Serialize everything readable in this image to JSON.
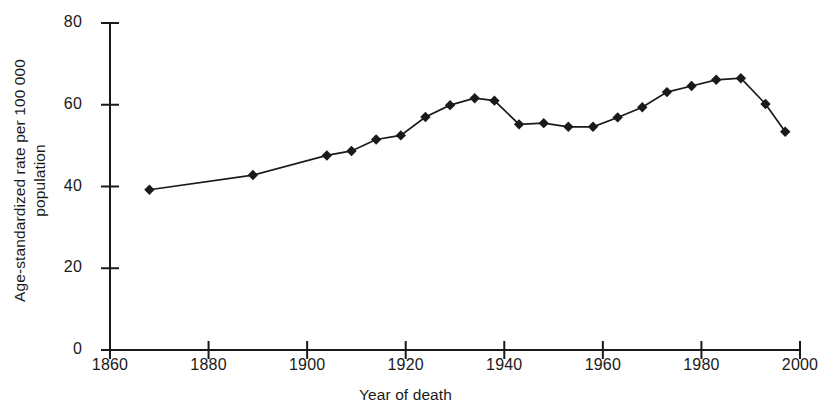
{
  "chart_data": {
    "type": "line",
    "title": "",
    "xlabel": "Year of death",
    "ylabel": "Age-standardized rate per 100 000 population",
    "ylabel_lines": [
      "Age-standardized rate per 100 000",
      "population"
    ],
    "xlim": [
      1860,
      2000
    ],
    "ylim": [
      0,
      80
    ],
    "xticks": [
      1860,
      1880,
      1900,
      1920,
      1940,
      1960,
      1980,
      2000
    ],
    "xtick_labels": [
      "1860",
      "1880",
      "1900",
      "1920",
      "1940",
      "1960",
      "1980",
      "2000"
    ],
    "yticks": [
      0,
      20,
      40,
      60,
      80
    ],
    "ytick_labels": [
      "0",
      "20",
      "40",
      "60",
      "80"
    ],
    "grid": false,
    "legend": false,
    "marker": "diamond",
    "marker_color": "#1a1a1a",
    "line_color": "#1a1a1a",
    "x": [
      1868,
      1889,
      1904,
      1909,
      1914,
      1919,
      1924,
      1929,
      1934,
      1938,
      1943,
      1948,
      1953,
      1958,
      1963,
      1968,
      1973,
      1978,
      1983,
      1988,
      1993,
      1997
    ],
    "values": [
      39.2,
      42.8,
      47.6,
      48.7,
      51.5,
      52.5,
      57.0,
      59.9,
      61.6,
      61.0,
      55.2,
      55.5,
      54.6,
      54.6,
      56.9,
      59.4,
      63.1,
      64.6,
      66.1,
      66.5,
      60.2,
      53.4
    ],
    "series": [
      {
        "name": "Age-standardized mortality rate",
        "values": [
          39.2,
          42.8,
          47.6,
          48.7,
          51.5,
          52.5,
          57.0,
          59.9,
          61.6,
          61.0,
          55.2,
          55.5,
          54.6,
          54.6,
          56.9,
          59.4,
          63.1,
          64.6,
          66.1,
          66.5,
          60.2,
          53.4
        ]
      }
    ]
  }
}
